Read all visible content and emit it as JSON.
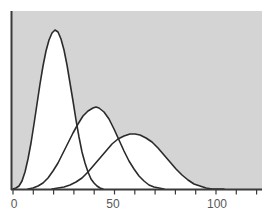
{
  "chart_data": {
    "type": "line",
    "title": "",
    "subtitle": "",
    "xlabel": "",
    "ylabel": "",
    "xlim": [
      0,
      124
    ],
    "ylim": [
      0,
      1
    ],
    "grid": false,
    "legend": null,
    "x_ticks_major": [
      0,
      50,
      100
    ],
    "x_tick_labels": [
      "0",
      "50",
      "100"
    ],
    "x_ticks_minor": [
      10,
      20,
      30,
      40,
      60,
      70,
      80,
      90,
      110,
      120
    ],
    "plot_background_color": "#d4d4d4",
    "axis_color": "#3a3a3a",
    "curve_line_color": "#2b2b2b",
    "curve_fill_color": "#ffffff",
    "series": [
      {
        "name": "curve-1",
        "peak_x": 20,
        "peak_y": 0.895,
        "start_x": 7,
        "end_x": 34,
        "points_px": "13,189 16,188 19,186 22,181 25,172 28,159 31,143 34,124 37,104 40,84 43,66 46,51 49,40 52,33 55,30 58,32 61,39 64,50 67,65 70,83 73,101 76,120 79,137 82,152 85,163 88,172 91,179 94,183 97,186 100,188 103,189"
      },
      {
        "name": "curve-2",
        "peak_x": 41,
        "peak_y": 0.46,
        "start_x": 15,
        "end_x": 66,
        "points_px": "28,189 33,188 38,186 43,183 48,178 53,171 58,163 63,153 68,143 73,133 78,124 83,116 88,111 93,108 96,107 99,108 104,112 109,119 114,129 119,140 124,151 129,161 134,169 139,176 144,181 149,185 154,187 159,188 164,189"
      },
      {
        "name": "curve-3",
        "peak_x": 60,
        "peak_y": 0.31,
        "start_x": 28,
        "end_x": 118,
        "points_px": "52,189 58,188 64,187 70,185 76,182 82,178 88,172 94,165 100,158 106,151 112,144 118,139 124,136 130,134 135,134 140,135 146,138 152,142 158,148 164,155 170,162 176,169 182,175 188,180 194,184 200,186 206,188 212,189 218,189 224,189"
      }
    ]
  },
  "axes": {
    "x_axis_name": "x-axis",
    "y_axis_name": "y-axis"
  }
}
